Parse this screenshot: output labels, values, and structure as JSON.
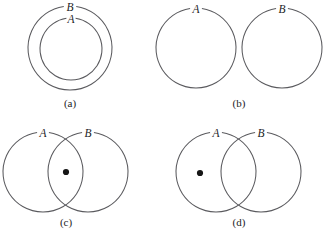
{
  "figure": {
    "background_color": "#ffffff",
    "stroke_color": "#5a5a5e",
    "dot_color": "#161616",
    "text_color": "#1d1d1f",
    "width": 330,
    "height": 232,
    "panels": [
      {
        "id": "a",
        "caption": "(a)",
        "caption_x": 70,
        "caption_y": 107,
        "relation": "A-subset-of-B",
        "circles": [
          {
            "set": "B",
            "cx": 70,
            "cy": 48,
            "r": 42,
            "label_angle_deg": -90
          },
          {
            "set": "A",
            "cx": 71,
            "cy": 49,
            "r": 31,
            "label_angle_deg": -90
          }
        ],
        "labels": [
          {
            "text": "B",
            "x": 70,
            "y": 11
          },
          {
            "text": "A",
            "x": 71,
            "y": 23
          }
        ],
        "dots": []
      },
      {
        "id": "b",
        "caption": "(b)",
        "caption_x": 239,
        "caption_y": 107,
        "relation": "A-disjoint-from-B",
        "circles": [
          {
            "set": "A",
            "cx": 196,
            "cy": 48,
            "r": 40,
            "label_angle_deg": -90
          },
          {
            "set": "B",
            "cx": 282,
            "cy": 48,
            "r": 40,
            "label_angle_deg": -90
          }
        ],
        "labels": [
          {
            "text": "A",
            "x": 196,
            "y": 13
          },
          {
            "text": "B",
            "x": 282,
            "y": 13
          }
        ],
        "dots": []
      },
      {
        "id": "c",
        "caption": "(c)",
        "caption_x": 66,
        "caption_y": 226,
        "relation": "point-in-A-intersect-B",
        "circles": [
          {
            "set": "A",
            "cx": 43,
            "cy": 172,
            "r": 40,
            "label_angle_deg": -90
          },
          {
            "set": "B",
            "cx": 88,
            "cy": 172,
            "r": 40,
            "label_angle_deg": -90
          }
        ],
        "labels": [
          {
            "text": "A",
            "x": 43,
            "y": 137
          },
          {
            "text": "B",
            "x": 88,
            "y": 137
          }
        ],
        "dots": [
          {
            "cx": 66,
            "cy": 172,
            "r": 3.1,
            "region": "A-intersect-B"
          }
        ]
      },
      {
        "id": "d",
        "caption": "(d)",
        "caption_x": 239,
        "caption_y": 226,
        "relation": "point-in-A-only",
        "circles": [
          {
            "set": "A",
            "cx": 216,
            "cy": 172,
            "r": 40,
            "label_angle_deg": -90
          },
          {
            "set": "B",
            "cx": 261,
            "cy": 172,
            "r": 40,
            "label_angle_deg": -90
          }
        ],
        "labels": [
          {
            "text": "A",
            "x": 216,
            "y": 137
          },
          {
            "text": "B",
            "x": 261,
            "y": 137
          }
        ],
        "dots": [
          {
            "cx": 200,
            "cy": 173,
            "r": 3.1,
            "region": "A-minus-B"
          }
        ]
      }
    ]
  }
}
